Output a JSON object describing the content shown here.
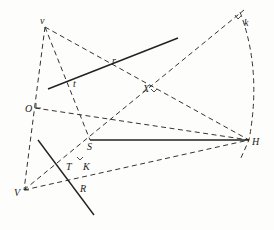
{
  "diagram": {
    "type": "geometric construction",
    "points": {
      "v": {
        "label": "v",
        "x": 45,
        "y": 27
      },
      "O": {
        "label": "O",
        "x": 35,
        "y": 108
      },
      "V": {
        "label": "V",
        "x": 24,
        "y": 190
      },
      "S": {
        "label": "S",
        "x": 90,
        "y": 140
      },
      "H": {
        "label": "H",
        "x": 249,
        "y": 140
      },
      "k": {
        "label": "k",
        "x": 240,
        "y": 12
      },
      "r": {
        "label": "r",
        "x": 117,
        "y": 61
      },
      "t": {
        "label": "t",
        "x": 70,
        "y": 81
      },
      "X": {
        "label": "X",
        "x": 155,
        "y": 85
      },
      "T": {
        "label": "T",
        "x": 79,
        "y": 160
      },
      "K": {
        "label": "K",
        "x": 79,
        "y": 160
      },
      "R": {
        "label": "R",
        "x": 88,
        "y": 181
      }
    },
    "labels": {
      "v": "v",
      "O": "O",
      "V": "V",
      "S": "S",
      "H": "H",
      "k": "k",
      "r": "r",
      "t": "t",
      "X": "X",
      "T": "T",
      "K": "K",
      "R": "R"
    },
    "solid_lines": [
      {
        "name": "line-rt",
        "from": [
          48,
          89
        ],
        "to": [
          178,
          38
        ]
      },
      {
        "name": "line-SH",
        "from": [
          90,
          140
        ],
        "to": [
          249,
          140
        ]
      },
      {
        "name": "line-TR",
        "from": [
          38,
          140
        ],
        "to": [
          94,
          215
        ]
      }
    ],
    "dashed_lines": [
      {
        "name": "v-O-V",
        "from": [
          45,
          27
        ],
        "to": [
          24,
          190
        ]
      },
      {
        "name": "v-S",
        "from": [
          45,
          27
        ],
        "to": [
          90,
          140
        ]
      },
      {
        "name": "v-H",
        "from": [
          45,
          27
        ],
        "to": [
          249,
          140
        ]
      },
      {
        "name": "O-H",
        "from": [
          35,
          108
        ],
        "to": [
          249,
          140
        ]
      },
      {
        "name": "V-k",
        "from": [
          24,
          190
        ],
        "to": [
          244,
          10
        ]
      },
      {
        "name": "V-H",
        "from": [
          24,
          190
        ],
        "to": [
          249,
          140
        ]
      }
    ],
    "arc": {
      "name": "arc-k-H",
      "from": [
        240,
        12
      ],
      "to": [
        249,
        140
      ]
    }
  }
}
